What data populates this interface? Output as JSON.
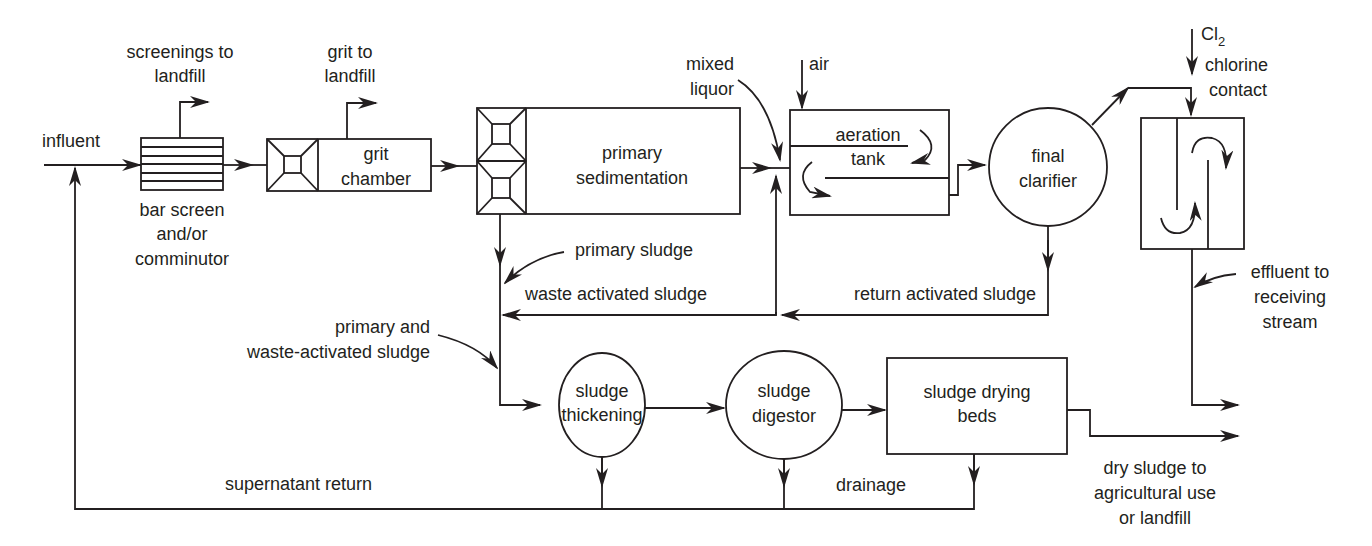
{
  "diagram": {
    "nodes": {
      "bar_screen": [
        "bar screen",
        "and/or",
        "comminutor"
      ],
      "grit_chamber": [
        "grit",
        "chamber"
      ],
      "primary_sedimentation": [
        "primary",
        "sedimentation"
      ],
      "aeration_tank": [
        "aeration",
        "tank"
      ],
      "final_clarifier": [
        "final",
        "clarifier"
      ],
      "chlorine_contact": [
        "chlorine",
        "contact"
      ],
      "sludge_thickening": [
        "sludge",
        "thickening"
      ],
      "sludge_digestor": [
        "sludge",
        "digestor"
      ],
      "sludge_drying_beds": [
        "sludge drying",
        "beds"
      ]
    },
    "labels": {
      "influent": "influent",
      "screenings": [
        "screenings to",
        "landfill"
      ],
      "grit": [
        "grit to",
        "landfill"
      ],
      "mixed_liquor": [
        "mixed",
        "liquor"
      ],
      "air": "air",
      "cl2": "Cl",
      "cl2_sub": "2",
      "primary_sludge": "primary  sludge",
      "waste_activated_sludge": "waste activated sludge",
      "return_activated_sludge": "return activated sludge",
      "primary_and_was": [
        "primary and",
        "waste-activated sludge"
      ],
      "effluent": [
        "effluent to",
        "receiving",
        "stream"
      ],
      "supernatant_return": "supernatant return",
      "drainage": "drainage",
      "dry_sludge": [
        "dry sludge to",
        "agricultural use",
        "or landfill"
      ]
    }
  }
}
